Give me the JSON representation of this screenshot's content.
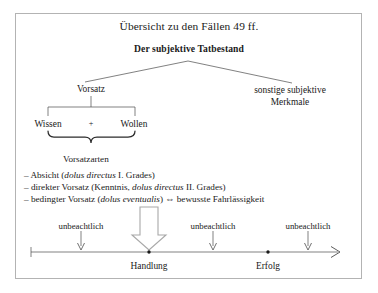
{
  "document": {
    "title": "Übersicht zu den Fällen 49 ff.",
    "subtitle": "Der subjektive Tatbestand"
  },
  "branches": {
    "left": "Vorsatz",
    "right_line1": "sonstige subjektive",
    "right_line2": "Merkmale"
  },
  "vorsatz_components": {
    "left": "Wissen",
    "operator": "+",
    "right": "Wollen"
  },
  "vorsatzarten": {
    "heading": "Vorsatzarten",
    "items": [
      {
        "dash": "–",
        "pre": " Absicht (",
        "italic": "dolus directus",
        "post": " I. Grades)"
      },
      {
        "dash": "–",
        "pre": " direkter Vorsatz (Kenntnis, ",
        "italic": "dolus directus",
        "post": " II. Grades)"
      },
      {
        "dash": "–",
        "pre": " bedingter Vorsatz (",
        "italic": "dolus eventualis",
        "post": ") ⇔ bewusste Fahrlässigkeit"
      }
    ]
  },
  "timeline": {
    "markers": [
      {
        "label": "unbeachtlich"
      },
      {
        "label": "unbeachtlich"
      },
      {
        "label": "unbeachtlich"
      }
    ],
    "points": [
      {
        "label": "Handlung"
      },
      {
        "label": "Erfolg"
      }
    ]
  },
  "colors": {
    "frame_border": "#b3b3b3",
    "line": "#4a4a4a",
    "text": "#1a1a1a",
    "block_arrow_stroke": "#a8a8a8",
    "block_arrow_fill": "#ffffff"
  }
}
